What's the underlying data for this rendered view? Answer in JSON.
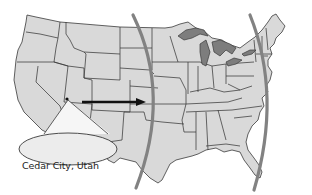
{
  "map": {
    "region": "Contiguous United States",
    "style": "grayscale state outline map",
    "colors": {
      "land": "#d9d9d9",
      "borders": "#3a3a3a",
      "great_lakes": "#7d7d7d",
      "wave_lines": "#828282",
      "arrow": "#111111",
      "background": "#ffffff"
    },
    "marker": {
      "label": "Cedar City, Utah",
      "icon": "location-dot"
    },
    "arrow": {
      "direction": "east",
      "icon": "arrow-right"
    },
    "wave_lines": [
      {
        "name": "central-wavefront",
        "shape": "arc"
      },
      {
        "name": "eastern-wavefront",
        "shape": "arc"
      }
    ]
  }
}
